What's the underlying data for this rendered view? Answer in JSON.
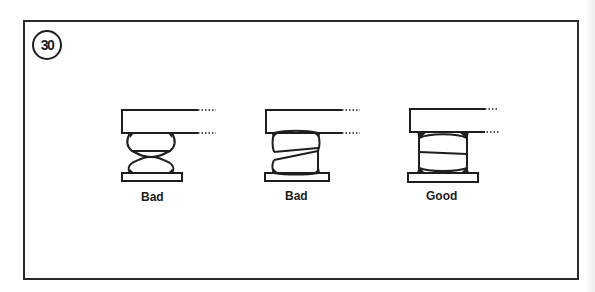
{
  "figure_number": "30",
  "figures": [
    {
      "id": "misaligned-hourglass",
      "label": "Bad"
    },
    {
      "id": "tilted-joint",
      "label": "Bad"
    },
    {
      "id": "flush-aligned",
      "label": "Good"
    }
  ],
  "colors": {
    "ink": "#1e1e1e",
    "paper": "#ffffff"
  }
}
